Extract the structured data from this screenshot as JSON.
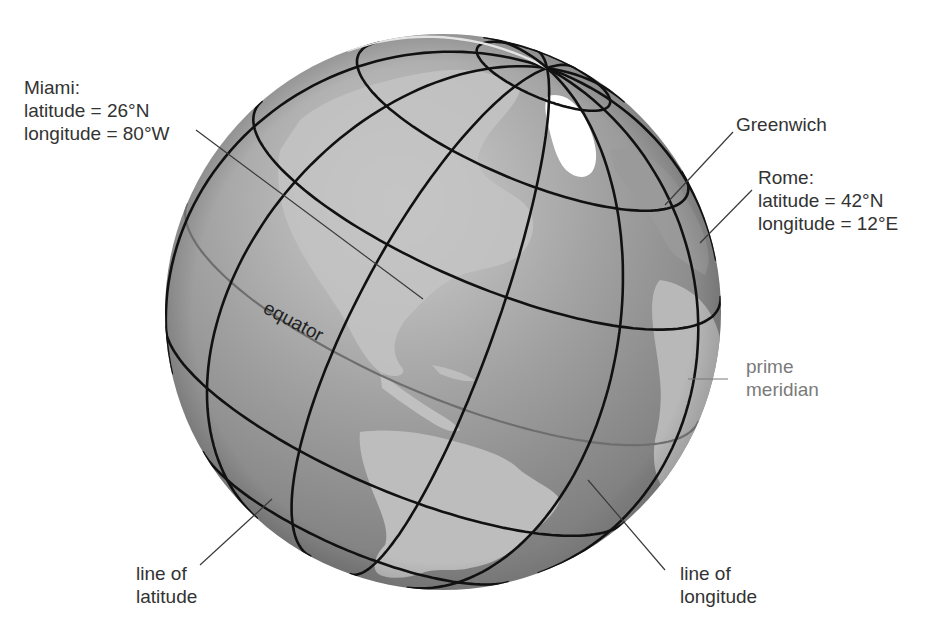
{
  "figure": {
    "title": "",
    "colors": {
      "ocean": "#8c8c8c",
      "ocean_highlight": "#c4c4c4",
      "land": "#b5b5b5",
      "land_light": "#d2d2d2",
      "ice": "#ffffff",
      "grid_line": "#111111",
      "equator_line": "#6e6e6e",
      "prime_meridian_line": "#e4e4e4",
      "label_text": "#333333",
      "prime_meridian_text": "#7a7a7a",
      "leader_line": "#3a3a3a"
    }
  },
  "labels": {
    "miami": {
      "title": "Miami:",
      "latitude": "latitude = 26°N",
      "longitude": "longitude = 80°W"
    },
    "greenwich": {
      "text": "Greenwich"
    },
    "rome": {
      "title": "Rome:",
      "latitude": "latitude = 42°N",
      "longitude": "longitude = 12°E"
    },
    "equator": {
      "text": "equator"
    },
    "prime_meridian": {
      "line1": "prime",
      "line2": "meridian"
    },
    "line_of_latitude": {
      "line1": "line of",
      "line2": "latitude"
    },
    "line_of_longitude": {
      "line1": "line of",
      "line2": "longitude"
    }
  },
  "globe": {
    "center": [
      443,
      312
    ],
    "radius": 278,
    "north_pole": [
      547,
      68
    ],
    "latitudes_drawn": [
      75,
      50,
      25,
      -25,
      -50
    ],
    "longitudes_drawn": [
      "every 30° meridian"
    ]
  }
}
